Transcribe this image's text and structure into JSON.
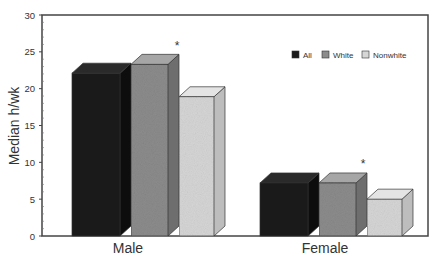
{
  "chart_data": {
    "type": "bar",
    "style": "3d-grouped",
    "title": "",
    "xlabel": "",
    "ylabel": "Median h/wk",
    "ylim": [
      0,
      30
    ],
    "yticks": [
      0,
      5,
      10,
      15,
      20,
      25,
      30
    ],
    "grid": false,
    "legend_position": "upper-right inside",
    "categories": [
      "Male",
      "Female"
    ],
    "series": [
      {
        "name": "All",
        "values": [
          22.1,
          7.2
        ],
        "color": "#1a1a1a"
      },
      {
        "name": "White",
        "values": [
          23.3,
          7.2
        ],
        "color": "#8c8c8c"
      },
      {
        "name": "Nonwhite",
        "values": [
          18.9,
          5.0
        ],
        "color": "#d6d6d6"
      }
    ],
    "annotations": [
      {
        "text": "*",
        "category": "Male",
        "near_series": "White"
      },
      {
        "text": "*",
        "category": "Female",
        "near_series": "Nonwhite"
      }
    ]
  },
  "labels": {
    "ylabel": "Median h/wk",
    "legend": [
      "All",
      "White",
      "Nonwhite"
    ],
    "categories": [
      "Male",
      "Female"
    ],
    "asterisk": "*"
  }
}
